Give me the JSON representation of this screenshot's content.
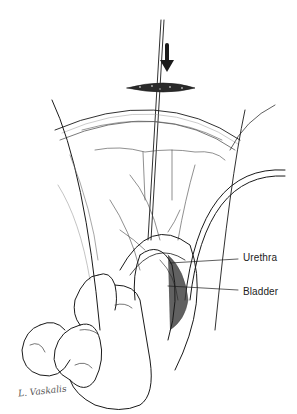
{
  "figure": {
    "labels": [
      {
        "text": "Urethra",
        "x": 243,
        "y": 252
      },
      {
        "text": "Bladder",
        "x": 243,
        "y": 286
      }
    ],
    "signature": "L. Vaskalis",
    "colors": {
      "ink": "#1a1a1a",
      "shade": "#6b6b6b",
      "background": "#ffffff"
    }
  }
}
